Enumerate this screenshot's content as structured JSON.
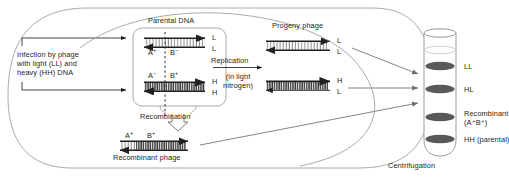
{
  "diagram": {
    "title_hidden": "Recombination between light (LL) and heavy (HH) phage DNA",
    "type": "biology-process-diagram"
  },
  "labels": {
    "infection": "Infection by phage\nwith light (LL) and\nheavy (HH) DNA",
    "parental_dna": "Parental DNA",
    "replication": "Replication",
    "replication_sub": "(in light\nnitrogen)",
    "recombination": "Recombination",
    "recombinant_phage": "Recombinant phage",
    "progeny_phage": "Progeny phage",
    "centrifugation": "Centrifugation"
  },
  "parental": {
    "strand_top": {
      "left_marker": "A",
      "left_sup": "+",
      "right_marker": "B",
      "right_sup": "−",
      "end_top": "L",
      "end_bottom": "L"
    },
    "strand_bottom": {
      "left_marker": "A",
      "left_sup": "−",
      "right_marker": "B",
      "right_sup": "+",
      "end_top": "H",
      "end_bottom": "H"
    }
  },
  "recombinant": {
    "left_marker": "A",
    "left_sup": "+",
    "right_marker": "B",
    "right_sup": "+"
  },
  "progeny": [
    {
      "end_top": "L",
      "end_bottom": "L"
    },
    {
      "end_top": "H",
      "end_bottom": "L"
    }
  ],
  "tube": {
    "bands": [
      {
        "label": "LL",
        "label2": ""
      },
      {
        "label": "HL",
        "label2": ""
      },
      {
        "label": "Recombinant",
        "label2": "(A⁺B⁺)"
      },
      {
        "label": "HH (parental)",
        "label2": ""
      }
    ]
  },
  "colors": {
    "ink": "#231f20",
    "line": "#6d6e71",
    "band": "#58595b",
    "tube_stroke": "#9a9b9d"
  }
}
